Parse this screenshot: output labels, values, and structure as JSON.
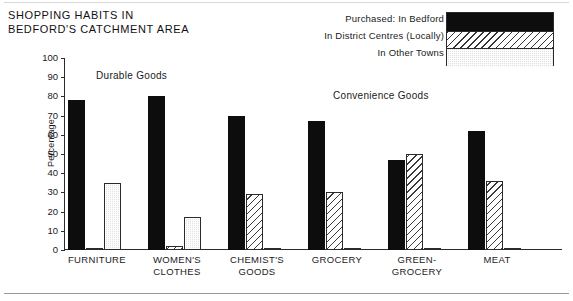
{
  "chart_data": {
    "type": "bar",
    "title": "SHOPPING HABITS IN\nBEDFORD'S CATCHMENT AREA",
    "xlabel": "",
    "ylabel": "Percentage",
    "ylim": [
      0,
      100
    ],
    "ytick_step": 10,
    "yticks": [
      0,
      10,
      20,
      30,
      40,
      50,
      60,
      70,
      80,
      90,
      100
    ],
    "grid": false,
    "legend_position": "top-right",
    "legend_prefix": "Purchased:",
    "categories": [
      "FURNITURE",
      "WOMEN'S\nCLOTHES",
      "CHEMIST'S\nGOODS",
      "GROCERY",
      "GREEN-\nGROCERY",
      "MEAT"
    ],
    "series": [
      {
        "name": "In Bedford",
        "pattern": "solid",
        "color": "#0d0d0d",
        "values": [
          78,
          80,
          70,
          67,
          47,
          62
        ]
      },
      {
        "name": "In District Centres (Locally)",
        "pattern": "hatch",
        "color": "#ffffff",
        "values": [
          1,
          2,
          29,
          30,
          50,
          36
        ]
      },
      {
        "name": "In Other Towns",
        "pattern": "stipple",
        "color": "#e4e4e4",
        "values": [
          35,
          17,
          1,
          1,
          1,
          1
        ]
      }
    ],
    "annotations": [
      {
        "id": "durable",
        "text": "Durable Goods"
      },
      {
        "id": "convenience",
        "text": "Convenience  Goods"
      }
    ]
  },
  "legend": {
    "entries": [
      "Purchased: In Bedford",
      "In District Centres (Locally)",
      "In Other Towns"
    ]
  }
}
